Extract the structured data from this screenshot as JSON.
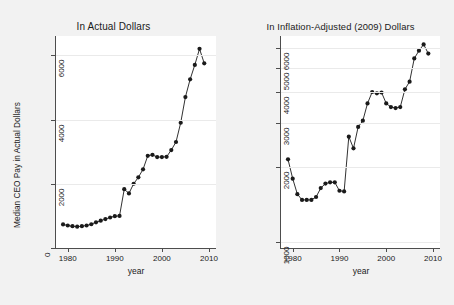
{
  "figure": {
    "background_color": "#f2f2f2",
    "plot_background_color": "#ffffff",
    "axis_color": "#4d4d4d",
    "series_color": "#1a1a1a",
    "grid_color": "#eaeaea"
  },
  "chart_data": [
    {
      "type": "line",
      "panel": "left",
      "title": "In Actual Dollars",
      "xlabel": "year",
      "ylabel": "Median CEO Pay in Actual Dollars",
      "yscale": "linear",
      "xlim": [
        1977.5,
        2011.5
      ],
      "ylim": [
        0,
        6600
      ],
      "xticks": [
        1980,
        1990,
        2000,
        2010
      ],
      "yticks": [
        0,
        2000,
        4000,
        6000
      ],
      "grid": true,
      "legend": "none",
      "markers": "filled-circle",
      "x": [
        1979,
        1980,
        1981,
        1982,
        1983,
        1984,
        1985,
        1986,
        1987,
        1988,
        1989,
        1990,
        1991,
        1992,
        1993,
        1994,
        1995,
        1996,
        1997,
        1998,
        1999,
        2000,
        2001,
        2002,
        2003,
        2004,
        2005,
        2006,
        2007,
        2008,
        2009
      ],
      "y": [
        735,
        700,
        680,
        665,
        680,
        700,
        740,
        800,
        850,
        900,
        950,
        990,
        1000,
        1830,
        1700,
        2000,
        2200,
        2450,
        2870,
        2900,
        2830,
        2830,
        2840,
        3050,
        3300,
        3900,
        4700,
        5250,
        5700,
        6200,
        5750
      ]
    },
    {
      "type": "line",
      "panel": "right",
      "title": "In Inflation-Adjusted (2009) Dollars",
      "xlabel": "year",
      "ylabel": "Median CEO Pay in 2009 Dollars",
      "yscale": "log",
      "xlim": [
        1977.5,
        2011.5
      ],
      "ylim": [
        950,
        6700
      ],
      "xticks": [
        1980,
        1990,
        2000,
        2010
      ],
      "yticks": [
        1000,
        2000,
        3000,
        4000,
        5000,
        6000
      ],
      "grid": true,
      "legend": "none",
      "markers": "filled-circle",
      "x": [
        1979,
        1980,
        1981,
        1982,
        1983,
        1984,
        1985,
        1986,
        1987,
        1988,
        1989,
        1990,
        1991,
        1992,
        1993,
        1994,
        1995,
        1996,
        1997,
        1998,
        1999,
        2000,
        2001,
        2002,
        2003,
        2004,
        2005,
        2006,
        2007,
        2008,
        2009
      ],
      "y": [
        2150,
        1800,
        1560,
        1480,
        1480,
        1480,
        1520,
        1650,
        1720,
        1740,
        1740,
        1610,
        1600,
        2650,
        2380,
        2900,
        3070,
        3600,
        4000,
        3950,
        3980,
        3600,
        3480,
        3450,
        3480,
        4100,
        4400,
        5450,
        5850,
        6200,
        5700
      ]
    }
  ],
  "panels": {
    "left": {
      "title": "In Actual Dollars",
      "xlabel": "year",
      "ylabel": "Median CEO Pay in Actual Dollars",
      "ytick_labels": [
        "6000",
        "4000",
        "2000",
        "0"
      ],
      "xtick_labels": [
        "1980",
        "1990",
        "2000",
        "2010"
      ]
    },
    "right": {
      "title": "In Inflation-Adjusted (2009) Dollars",
      "xlabel": "year",
      "ylabel": "Median CEO Pay in 2009 Dollars",
      "ytick_labels": [
        "6000",
        "5000",
        "4000",
        "3000",
        "2000",
        "1000"
      ],
      "xtick_labels": [
        "1980",
        "1990",
        "2000",
        "2010"
      ]
    }
  }
}
